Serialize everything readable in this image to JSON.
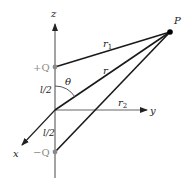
{
  "diagram": {
    "type": "dipole-geometry",
    "axes": {
      "z_label": "z",
      "y_label": "y",
      "x_label": "x"
    },
    "charges": {
      "positive_label": "+Q",
      "negative_label": "−Q"
    },
    "point_label": "P",
    "distances": {
      "r1_label": "r",
      "r1_sub": "1",
      "r_label": "r",
      "r2_label": "r",
      "r2_sub": "2"
    },
    "half_separation_upper": "l/2",
    "half_separation_lower": "l/2",
    "angle_label": "θ",
    "colors": {
      "line": "#1a1a1a",
      "axis": "#555555",
      "charge": "#8a8a8a",
      "point": "#000000"
    }
  }
}
